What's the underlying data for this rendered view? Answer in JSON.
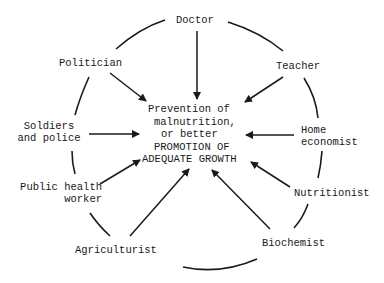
{
  "diagram": {
    "center": {
      "line1": "Prevention  of",
      "line2": "malnutrition,",
      "line3": "or better",
      "line4": "PROMOTION OF",
      "line5": "ADEQUATE  GROWTH"
    },
    "nodes": {
      "doctor": "Doctor",
      "teacher": "Teacher",
      "home_economist_1": "Home",
      "home_economist_2": "economist",
      "nutritionist": "Nutritionist",
      "biochemist": "Biochemist",
      "agriculturist": "Agriculturist",
      "public_health_1": "Public health",
      "public_health_2": "worker",
      "soldiers_1": "Soldiers",
      "soldiers_2": "and police",
      "politician": "Politician"
    },
    "colors": {
      "ink": "#1a1a1a",
      "background": "#ffffff"
    }
  }
}
